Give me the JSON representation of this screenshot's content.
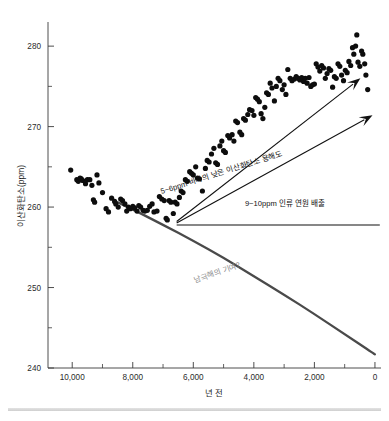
{
  "chart_data": {
    "type": "scatter",
    "title": "",
    "xlabel": "년 전",
    "ylabel": "이산화탄소(ppm)",
    "xlim": [
      10800,
      -200
    ],
    "ylim": [
      240,
      283
    ],
    "x_ticks": [
      10000,
      8000,
      6000,
      4000,
      2000,
      0
    ],
    "x_tick_labels": [
      "10,000",
      "8,000",
      "6,000",
      "4,000",
      "2,000",
      "0"
    ],
    "x_minor_ticks": [
      9000,
      7000,
      5000,
      3000,
      1000
    ],
    "y_ticks": [
      240,
      250,
      260,
      270,
      280
    ],
    "y_tick_labels": [
      "240",
      "250",
      "260",
      "270",
      "280"
    ],
    "y_minor_ticks": [
      245,
      255,
      265,
      275
    ],
    "grid": false,
    "legend": "none",
    "series": [
      {
        "name": "이산화탄소 농도 측정값",
        "marker": "filled-circle",
        "color": "#0d0d0d",
        "points": [
          [
            10050,
            264.6
          ],
          [
            9850,
            263.4
          ],
          [
            9800,
            263.2
          ],
          [
            9740,
            263.6
          ],
          [
            9700,
            263.5
          ],
          [
            9650,
            263.3
          ],
          [
            9560,
            262.9
          ],
          [
            9500,
            263.4
          ],
          [
            9420,
            263.4
          ],
          [
            9350,
            262.7
          ],
          [
            9300,
            260.9
          ],
          [
            9260,
            260.6
          ],
          [
            9180,
            264.0
          ],
          [
            9120,
            263.0
          ],
          [
            9000,
            261.8
          ],
          [
            8880,
            259.8
          ],
          [
            8800,
            259.4
          ],
          [
            8700,
            261.1
          ],
          [
            8600,
            260.7
          ],
          [
            8560,
            260.4
          ],
          [
            8480,
            260.0
          ],
          [
            8400,
            261.0
          ],
          [
            8340,
            260.8
          ],
          [
            8260,
            260.4
          ],
          [
            8200,
            259.5
          ],
          [
            8140,
            260.0
          ],
          [
            8080,
            259.8
          ],
          [
            8000,
            260.1
          ],
          [
            7940,
            259.9
          ],
          [
            7860,
            259.5
          ],
          [
            7800,
            260.2
          ],
          [
            7740,
            260.0
          ],
          [
            7660,
            259.6
          ],
          [
            7600,
            259.5
          ],
          [
            7520,
            259.6
          ],
          [
            7440,
            260.1
          ],
          [
            7360,
            260.4
          ],
          [
            7300,
            259.4
          ],
          [
            7200,
            259.5
          ],
          [
            7120,
            261.3
          ],
          [
            7040,
            261.0
          ],
          [
            6960,
            260.8
          ],
          [
            6900,
            258.6
          ],
          [
            6860,
            258.4
          ],
          [
            6800,
            260.8
          ],
          [
            6740,
            260.6
          ],
          [
            6660,
            259.2
          ],
          [
            6600,
            260.6
          ],
          [
            6540,
            260.4
          ],
          [
            6460,
            261.2
          ],
          [
            6400,
            262.0
          ],
          [
            6340,
            261.8
          ],
          [
            6260,
            263.4
          ],
          [
            6200,
            263.2
          ],
          [
            6120,
            264.4
          ],
          [
            6060,
            264.2
          ],
          [
            6000,
            264.0
          ],
          [
            5920,
            265.0
          ],
          [
            5860,
            263.6
          ],
          [
            5800,
            263.5
          ],
          [
            5700,
            262.0
          ],
          [
            5600,
            264.8
          ],
          [
            5540,
            265.8
          ],
          [
            5480,
            265.6
          ],
          [
            5400,
            266.6
          ],
          [
            5320,
            267.3
          ],
          [
            5260,
            265.5
          ],
          [
            5200,
            265.3
          ],
          [
            5120,
            267.6
          ],
          [
            5060,
            268.2
          ],
          [
            5000,
            267.0
          ],
          [
            4940,
            266.8
          ],
          [
            4860,
            268.9
          ],
          [
            4800,
            268.6
          ],
          [
            4720,
            269.0
          ],
          [
            4660,
            268.2
          ],
          [
            4600,
            270.7
          ],
          [
            4540,
            270.5
          ],
          [
            4460,
            269.3
          ],
          [
            4400,
            269.0
          ],
          [
            4340,
            271.0
          ],
          [
            4280,
            270.8
          ],
          [
            4200,
            271.5
          ],
          [
            4140,
            272.1
          ],
          [
            4060,
            272.0
          ],
          [
            4000,
            271.4
          ],
          [
            3940,
            273.6
          ],
          [
            3880,
            273.4
          ],
          [
            3820,
            273.1
          ],
          [
            3760,
            271.6
          ],
          [
            3700,
            271.0
          ],
          [
            3640,
            272.4
          ],
          [
            3580,
            274.2
          ],
          [
            3520,
            274.0
          ],
          [
            3460,
            275.4
          ],
          [
            3400,
            274.8
          ],
          [
            3320,
            273.2
          ],
          [
            3260,
            275.0
          ],
          [
            3200,
            276.0
          ],
          [
            3140,
            275.7
          ],
          [
            3060,
            274.6
          ],
          [
            3000,
            275.2
          ],
          [
            2940,
            274.0
          ],
          [
            2880,
            277.1
          ],
          [
            2800,
            276.0
          ],
          [
            2740,
            275.7
          ],
          [
            2660,
            275.9
          ],
          [
            2600,
            276.2
          ],
          [
            2540,
            276.0
          ],
          [
            2480,
            275.8
          ],
          [
            2420,
            276.1
          ],
          [
            2360,
            275.6
          ],
          [
            2300,
            276.0
          ],
          [
            2240,
            275.4
          ],
          [
            2180,
            276.1
          ],
          [
            2120,
            275.0
          ],
          [
            2060,
            275.2
          ],
          [
            2000,
            275.3
          ],
          [
            1940,
            277.8
          ],
          [
            1880,
            277.4
          ],
          [
            1820,
            276.9
          ],
          [
            1760,
            277.6
          ],
          [
            1700,
            277.3
          ],
          [
            1640,
            276.0
          ],
          [
            1580,
            276.6
          ],
          [
            1520,
            277.2
          ],
          [
            1460,
            277.0
          ],
          [
            1400,
            274.9
          ],
          [
            1340,
            276.2
          ],
          [
            1280,
            276.0
          ],
          [
            1220,
            277.8
          ],
          [
            1160,
            277.5
          ],
          [
            1100,
            276.4
          ],
          [
            1040,
            275.7
          ],
          [
            980,
            277.0
          ],
          [
            920,
            276.7
          ],
          [
            860,
            278.1
          ],
          [
            800,
            277.6
          ],
          [
            740,
            279.8
          ],
          [
            700,
            279.0
          ],
          [
            640,
            280.0
          ],
          [
            600,
            281.4
          ],
          [
            560,
            278.0
          ],
          [
            500,
            277.5
          ],
          [
            440,
            279.4
          ],
          [
            400,
            279.0
          ],
          [
            340,
            277.8
          ],
          [
            300,
            276.4
          ],
          [
            240,
            274.6
          ]
        ]
      }
    ],
    "curves": [
      {
        "name": "남극해의 기여 곡선",
        "label": "남극해의 기여?",
        "color": "#4a4a4a",
        "style": "solid-thick",
        "points": [
          [
            8500,
            260.6
          ],
          [
            8000,
            259.7
          ],
          [
            7000,
            257.8
          ],
          [
            6000,
            255.8
          ],
          [
            5000,
            253.7
          ],
          [
            4000,
            251.4
          ],
          [
            3000,
            249.1
          ],
          [
            2000,
            246.7
          ],
          [
            1000,
            244.2
          ],
          [
            0,
            241.7
          ]
        ]
      }
    ],
    "annotations": [
      {
        "name": "upper-arrow",
        "label": "",
        "type": "arrow",
        "from": [
          6550,
          258.2
        ],
        "to": [
          480,
          276.0
        ]
      },
      {
        "name": "ocean-solubility-arrow",
        "label": "5~6ppm 바다의 낮은 이산화탄소 용해도",
        "type": "arrow-with-label",
        "from": [
          6550,
          258.2
        ],
        "to": [
          80,
          271.4
        ],
        "rotation_deg": -17.5
      },
      {
        "name": "anthropogenic-emissions-line",
        "label": "9~10ppm 인류 연원 배출",
        "type": "line-with-label",
        "from": [
          6550,
          258.1
        ],
        "to": [
          -160,
          258.1
        ]
      }
    ]
  },
  "figure": {
    "axis_title_x": "년 전",
    "axis_title_y": "이산화탄소(ppm)"
  }
}
